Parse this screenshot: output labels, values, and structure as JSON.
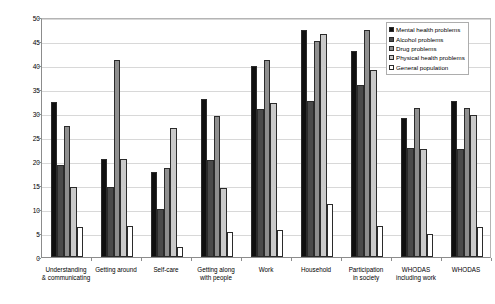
{
  "chart_data": {
    "type": "bar",
    "title": "",
    "xlabel": "",
    "ylabel": "Adjusted means",
    "ylim": [
      0,
      50
    ],
    "ytick_step": 5,
    "yticks": [
      "0",
      "5",
      "10",
      "15",
      "20",
      "25",
      "30",
      "35",
      "40",
      "45",
      "50"
    ],
    "grid": "horizontal",
    "legend_position": "top-right",
    "categories": [
      "Understanding\n& communicating",
      "Getting around",
      "Self-care",
      "Getting along\nwith people",
      "Work",
      "Household",
      "Participation\nin society",
      "WHODAS\nincluding work",
      "WHODAS"
    ],
    "series": [
      {
        "name": "Mental health problems",
        "color": "#101010",
        "values": [
          32.3,
          20.5,
          17.8,
          33.0,
          39.8,
          47.3,
          43.0,
          29.0,
          32.5
        ]
      },
      {
        "name": "Alcohol problems",
        "color": "#4a4a4a",
        "values": [
          19.1,
          14.5,
          10.1,
          20.2,
          30.9,
          32.5,
          35.8,
          22.8,
          22.5
        ]
      },
      {
        "name": "Drug problems",
        "color": "#8e8e8e",
        "values": [
          27.2,
          41.0,
          18.5,
          29.4,
          41.0,
          45.0,
          47.3,
          31.0,
          31.0
        ]
      },
      {
        "name": "Physical health problems",
        "color": "#c9c9c9",
        "values": [
          14.5,
          20.5,
          26.8,
          14.4,
          32.0,
          46.5,
          39.0,
          22.5,
          29.5
        ]
      },
      {
        "name": "General population",
        "color": "#ffffff",
        "values": [
          6.2,
          6.5,
          2.0,
          5.3,
          5.6,
          11.0,
          6.5,
          4.8,
          6.2
        ]
      }
    ]
  }
}
